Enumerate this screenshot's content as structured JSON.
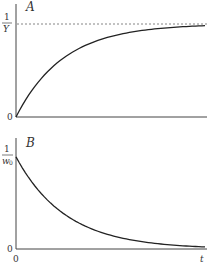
{
  "chart_data": [
    {
      "type": "line",
      "panel_label": "A",
      "title": "A",
      "xlabel": "t",
      "ylabel": "",
      "y_ticks": [
        "0",
        "1/Y"
      ],
      "x_ticks": [
        "0"
      ],
      "asymptote": {
        "label": "1/Y",
        "style": "dashed",
        "value": 1.0
      },
      "description": "Saturating growth from 0 approaching asymptote 1/Y",
      "x": [
        0,
        0.1,
        0.2,
        0.3,
        0.4,
        0.5,
        0.6,
        0.7,
        0.8,
        0.9,
        1.0
      ],
      "values": [
        0,
        0.33,
        0.55,
        0.7,
        0.8,
        0.87,
        0.91,
        0.94,
        0.96,
        0.97,
        0.98
      ],
      "ylim": [
        0,
        1.05
      ],
      "xlim": [
        0,
        1
      ]
    },
    {
      "type": "line",
      "panel_label": "B",
      "title": "B",
      "xlabel": "t",
      "ylabel": "",
      "y_ticks": [
        "0",
        "1/w0"
      ],
      "x_ticks": [
        "0"
      ],
      "description": "Exponential decay from 1/w0 toward 0",
      "x": [
        0,
        0.1,
        0.2,
        0.3,
        0.4,
        0.5,
        0.6,
        0.7,
        0.8,
        0.9,
        1.0
      ],
      "values": [
        1.0,
        0.7,
        0.5,
        0.35,
        0.25,
        0.17,
        0.12,
        0.08,
        0.05,
        0.03,
        0.02
      ],
      "ylim": [
        0,
        1.05
      ],
      "xlim": [
        0,
        1
      ]
    }
  ],
  "labels": {
    "panelA": "A",
    "panelB": "B",
    "one": "1",
    "Y": "Y",
    "w": "w",
    "w_sub": "0",
    "zero": "0",
    "t": "t"
  }
}
